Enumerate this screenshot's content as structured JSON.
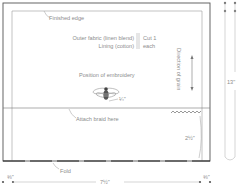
{
  "diagram": {
    "type": "sewing-pattern",
    "labels": {
      "finished_edge": "Finished edge",
      "outer_fabric": "Outer fabric (linen blend)",
      "lining": "Lining (cotton)",
      "cut_line1": "Cut 1",
      "cut_line2": "each",
      "position_of_embroidery": "Position of embroidery",
      "embroidery_offset": "¼\"",
      "attach_braid": "Attach braid here",
      "direction_of_grain": "Direction of grain",
      "braid_height": "2½\"",
      "fold": "Fold"
    },
    "dimensions": {
      "height": "13\"",
      "width": "7½\"",
      "seam_left": "⅜\"",
      "seam_right": "⅜\""
    },
    "colors": {
      "outline": "#555555",
      "inner_line": "#9a9a9a",
      "text": "#8c8c8c"
    },
    "icons": [
      "bee-embroidery-icon",
      "grain-arrow-icon",
      "zigzag-braid-icon"
    ]
  }
}
